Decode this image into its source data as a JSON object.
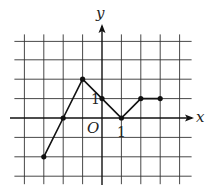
{
  "chart_data": {
    "type": "line",
    "title": "",
    "xlabel": "x",
    "ylabel": "y",
    "origin_label": "O",
    "x_tick_label": "1",
    "y_tick_label": "1",
    "grid": true,
    "xlim": [
      -4,
      4
    ],
    "ylim": [
      -3,
      4
    ],
    "points": [
      {
        "x": -3,
        "y": -2
      },
      {
        "x": -2,
        "y": 0
      },
      {
        "x": -1,
        "y": 2
      },
      {
        "x": 0,
        "y": 1
      },
      {
        "x": 1,
        "y": 0
      },
      {
        "x": 2,
        "y": 1
      },
      {
        "x": 3,
        "y": 1
      }
    ]
  },
  "axes": {
    "x_label": "x",
    "y_label": "y",
    "origin": "O",
    "x_unit": "1",
    "y_unit": "1"
  }
}
